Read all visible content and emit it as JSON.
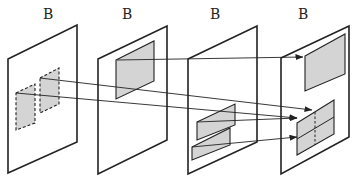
{
  "diagram": {
    "type": "layer-projection",
    "colors": {
      "stroke": "#222222",
      "fill": "#d4d4d4",
      "background": "#ffffff"
    },
    "panels": [
      {
        "id": "panel-1",
        "label": "B",
        "label_pos": [
          43,
          20
        ],
        "frame": [
          [
            8,
            59
          ],
          [
            77,
            25
          ],
          [
            77,
            142
          ],
          [
            8,
            173
          ]
        ],
        "regions": [
          {
            "name": "dashed-region-left",
            "style": "dashed",
            "points": [
              [
                16,
                93
              ],
              [
                35,
                84
              ],
              [
                35,
                123
              ],
              [
                16,
                130
              ]
            ]
          },
          {
            "name": "dashed-region-right",
            "style": "dashed",
            "points": [
              [
                40,
                78
              ],
              [
                59,
                68
              ],
              [
                59,
                104
              ],
              [
                40,
                113
              ]
            ]
          }
        ]
      },
      {
        "id": "panel-2",
        "label": "B",
        "label_pos": [
          122,
          20
        ],
        "frame": [
          [
            98,
            59
          ],
          [
            167,
            26
          ],
          [
            167,
            140
          ],
          [
            98,
            174
          ]
        ],
        "regions": [
          {
            "name": "shaded-region",
            "style": "solid",
            "points": [
              [
                116,
                60
              ],
              [
                154,
                41
              ],
              [
                154,
                81
              ],
              [
                116,
                99
              ]
            ]
          }
        ]
      },
      {
        "id": "panel-3",
        "label": "B",
        "label_pos": [
          210,
          20
        ],
        "frame": [
          [
            188,
            59
          ],
          [
            257,
            26
          ],
          [
            257,
            142
          ],
          [
            188,
            174
          ]
        ],
        "regions": [
          {
            "name": "shaded-region-upper",
            "style": "solid",
            "points": [
              [
                197,
                122
              ],
              [
                235,
                104
              ],
              [
                235,
                125
              ],
              [
                197,
                140
              ]
            ]
          },
          {
            "name": "shaded-region-lower",
            "style": "solid",
            "points": [
              [
                192,
                147
              ],
              [
                230,
                128
              ],
              [
                230,
                145
              ],
              [
                192,
                160
              ]
            ]
          }
        ]
      },
      {
        "id": "panel-4",
        "label": "B",
        "label_pos": [
          298,
          20
        ],
        "frame": [
          [
            281,
            58
          ],
          [
            349,
            26
          ],
          [
            349,
            137
          ],
          [
            281,
            174
          ]
        ],
        "regions": [
          {
            "name": "shaded-region-top",
            "style": "solid",
            "points": [
              [
                305,
                56
              ],
              [
                345,
                34
              ],
              [
                345,
                74
              ],
              [
                305,
                91
              ]
            ]
          },
          {
            "name": "shaded-region-bottom",
            "style": "solid",
            "points": [
              [
                297,
                123
              ],
              [
                334,
                100
              ],
              [
                334,
                134
              ],
              [
                297,
                155
              ]
            ]
          }
        ],
        "dividers": [
          {
            "name": "horizontal-divider",
            "style": "solid",
            "from": [
              297,
              139
            ],
            "to": [
              334,
              117
            ]
          },
          {
            "name": "vertical-divider",
            "style": "dashed",
            "from": [
              315,
              112
            ],
            "to": [
              315,
              145
            ]
          }
        ]
      }
    ],
    "arrows": [
      {
        "name": "arrow-panel2-to-panel4-top",
        "from": [
          117,
          60
        ],
        "to": [
          303,
          57
        ]
      },
      {
        "name": "arrow-panel1-right-to-panel4",
        "from": [
          40,
          78
        ],
        "to": [
          312,
          110
        ]
      },
      {
        "name": "arrow-panel1-left-to-panel4",
        "from": [
          16,
          93
        ],
        "to": [
          297,
          118
        ]
      },
      {
        "name": "arrow-panel3-upper-to-panel4",
        "from": [
          197,
          122
        ],
        "to": [
          297,
          118
        ]
      },
      {
        "name": "arrow-panel3-lower-to-panel4",
        "from": [
          192,
          147
        ],
        "to": [
          297,
          137
        ]
      }
    ]
  }
}
